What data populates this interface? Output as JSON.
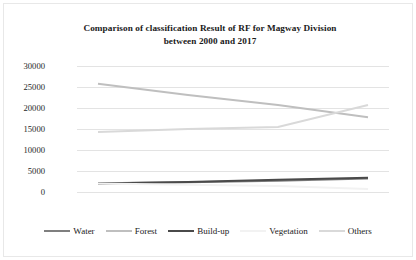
{
  "chart_data": {
    "type": "line",
    "title": "Comparison of classification Result of RF for Magway Division between 2000 and 2017",
    "title_line1": "Comparison of classification Result of RF for Magway Division",
    "title_line2": "between 2000 and 2017",
    "xlabel": "",
    "ylabel": "",
    "categories": [
      "2000",
      "2005",
      "2010",
      "2017"
    ],
    "x": [
      2000,
      2005,
      2010,
      2017
    ],
    "ylim": [
      0,
      30000
    ],
    "yticks": [
      0,
      5000,
      10000,
      15000,
      20000,
      25000,
      30000
    ],
    "ytick_labels": [
      "0",
      "5000",
      "10000",
      "15000",
      "20000",
      "25000",
      "30000"
    ],
    "grid": true,
    "legend_position": "bottom",
    "series": [
      {
        "name": "Water",
        "values": [
          2100,
          2300,
          2700,
          3200
        ],
        "color": "#7f7f7f"
      },
      {
        "name": "Forest",
        "values": [
          25800,
          23100,
          20700,
          17800
        ],
        "color": "#bfbfbf"
      },
      {
        "name": "Build-up",
        "values": [
          2000,
          2400,
          2900,
          3400
        ],
        "color": "#4a4a4a"
      },
      {
        "name": "Vegetation",
        "values": [
          2000,
          1700,
          1400,
          700
        ],
        "color": "#f2f2f2"
      },
      {
        "name": "Others",
        "values": [
          14300,
          15000,
          15500,
          20700
        ],
        "color": "#d9d9d9"
      }
    ]
  },
  "legend": {
    "items": [
      {
        "label": "Water"
      },
      {
        "label": "Forest"
      },
      {
        "label": "Build-up"
      },
      {
        "label": "Vegetation"
      },
      {
        "label": "Others"
      }
    ]
  }
}
